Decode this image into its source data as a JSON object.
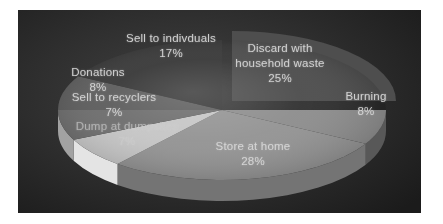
{
  "chart_data": {
    "type": "pie",
    "style": "3d-exploded",
    "title": "",
    "unit": "%",
    "direction": "clockwise",
    "start_angle_deg": 0,
    "legend": "none",
    "panel_background": "#2d2d2d",
    "label_color": "#d8d8d8",
    "slices": [
      {
        "label": "Discard with household waste",
        "value": 25,
        "pct": "25%",
        "color": "#4e4e4e",
        "side": "#3a3a3a",
        "exploded": true
      },
      {
        "label": "Burning",
        "value": 8,
        "pct": "8%",
        "color": "#8e8e8e",
        "side": "#585858",
        "exploded": false
      },
      {
        "label": "Store at home",
        "value": 28,
        "pct": "28%",
        "color": "#949494",
        "side": "#747474",
        "exploded": false
      },
      {
        "label": "Dump at dumpsites",
        "value": 7,
        "pct": "7%",
        "color": "#c6c6c6",
        "side": "#e4e4e4",
        "exploded": false
      },
      {
        "label": "Sell to recyclers",
        "value": 7,
        "pct": "7%",
        "color": "#6f6f6f",
        "side": "#a2a2a2",
        "exploded": false
      },
      {
        "label": "Donations",
        "value": 8,
        "pct": "8%",
        "color": "#5f5f5f",
        "side": "#4a4a4a",
        "exploded": false
      },
      {
        "label": "Sell to indivduals",
        "value": 17,
        "pct": "17%",
        "color": "#3b3b3b",
        "side": "#2e2e2e",
        "exploded": false
      }
    ]
  }
}
